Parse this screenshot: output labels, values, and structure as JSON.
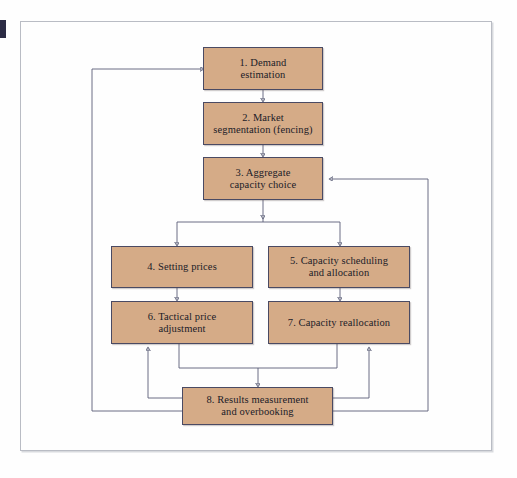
{
  "figure": {
    "type": "flowchart",
    "title": "",
    "background_color": "#fefefe",
    "frame_color": "#b9bcc4",
    "node_fill_color": "#d5ab87",
    "node_border_color": "#4a4a63",
    "edge_color": "#5b5f78"
  },
  "nodes": [
    {
      "id": "n1",
      "number": "1.",
      "line1": "1. Demand",
      "line2": "estimation"
    },
    {
      "id": "n2",
      "number": "2.",
      "line1": "2. Market",
      "line2": "segmentation (fencing)"
    },
    {
      "id": "n3",
      "number": "3.",
      "line1": "3. Aggregate",
      "line2": "capacity choice"
    },
    {
      "id": "n4",
      "number": "4.",
      "line1": "4. Setting prices",
      "line2": ""
    },
    {
      "id": "n5",
      "number": "5.",
      "line1": "5. Capacity scheduling",
      "line2": "and allocation"
    },
    {
      "id": "n6",
      "number": "6.",
      "line1": "6. Tactical price",
      "line2": "adjustment"
    },
    {
      "id": "n7",
      "number": "7.",
      "line1": "7. Capacity reallocation",
      "line2": ""
    },
    {
      "id": "n8",
      "number": "8.",
      "line1": "8. Results measurement",
      "line2": "and overbooking"
    }
  ],
  "edges": [
    {
      "from": "n1",
      "to": "n2",
      "kind": "down"
    },
    {
      "from": "n2",
      "to": "n3",
      "kind": "down"
    },
    {
      "from": "n3",
      "to": "n4",
      "kind": "split-down"
    },
    {
      "from": "n3",
      "to": "n5",
      "kind": "split-down"
    },
    {
      "from": "n4",
      "to": "n6",
      "kind": "down"
    },
    {
      "from": "n5",
      "to": "n7",
      "kind": "down"
    },
    {
      "from": "n6",
      "to": "n8",
      "kind": "merge-down"
    },
    {
      "from": "n7",
      "to": "n8",
      "kind": "merge-down"
    },
    {
      "from": "n8",
      "to": "n6",
      "kind": "feedback-up-left"
    },
    {
      "from": "n8",
      "to": "n7",
      "kind": "feedback-up-right"
    },
    {
      "from": "n8",
      "to": "n1",
      "kind": "feedback-loop-left"
    },
    {
      "from": "n8",
      "to": "n3",
      "kind": "feedback-loop-right"
    }
  ]
}
